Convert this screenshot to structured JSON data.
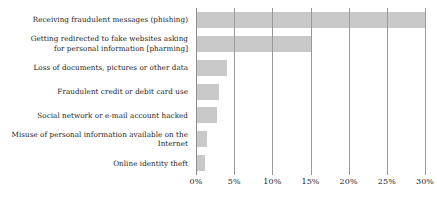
{
  "chart_data": {
    "type": "bar",
    "orientation": "horizontal",
    "title": "",
    "xlabel": "",
    "ylabel": "",
    "categories": [
      "Receiving fraudulent messages (phishing)",
      "Getting redirected to fake websites asking\nfor personal information [pharming]",
      "Loss of documents, pictures or other data",
      "Fraudulent credit or debit card use",
      "Social network or e-mail account hacked",
      "Misuse of personal information available on the Internet",
      "Online identity theft"
    ],
    "values": [
      30,
      15,
      4,
      3,
      2.7,
      1.5,
      1.2
    ],
    "xlim": [
      0,
      30
    ],
    "xticks": [
      0,
      5,
      10,
      15,
      20,
      25,
      30
    ],
    "xtick_labels": [
      "0%",
      "5%",
      "10%",
      "15%",
      "20%",
      "25%",
      "30%"
    ],
    "grid": true,
    "grid_axis": "x",
    "legend": false,
    "bar_color": "#c9c9c9",
    "gridline_color": "#9a9a9a",
    "text_color": "#1a1a1a"
  }
}
